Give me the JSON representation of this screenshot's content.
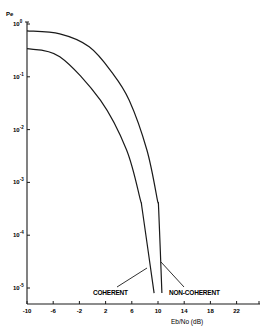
{
  "chart_data": {
    "type": "line",
    "title": "",
    "xlabel": "Eb/No (dB)",
    "ylabel": "Pe",
    "yscale": "log",
    "xlim": [
      -10,
      30
    ],
    "ylim": [
      1e-05,
      1
    ],
    "grid": false,
    "legend": "inline annotations with leader lines near bottom",
    "x_ticks": [
      -10,
      -6,
      -2,
      2,
      6,
      10,
      14,
      18,
      22
    ],
    "x_tick_labels": [
      "-10",
      "-6",
      "-2",
      "2",
      "6",
      "10",
      "14",
      "18",
      "22"
    ],
    "y_ticks": [
      1,
      0.1,
      0.01,
      0.001,
      0.0001,
      1e-05
    ],
    "y_tick_labels": [
      {
        "base": "10",
        "exp": "0"
      },
      {
        "base": "10",
        "exp": "-1"
      },
      {
        "base": "10",
        "exp": "-2"
      },
      {
        "base": "10",
        "exp": "-3"
      },
      {
        "base": "10",
        "exp": "-4"
      },
      {
        "base": "10",
        "exp": "-5"
      }
    ],
    "series": [
      {
        "name": "COHERENT",
        "x": [
          -10,
          -5,
          1.2,
          5.2,
          7.3,
          7.6,
          9.4
        ],
        "values": [
          0.34,
          0.24,
          0.036,
          0.0041,
          0.00047,
          0.0003,
          8e-06
        ]
      },
      {
        "name": "NON-COHERENT",
        "x": [
          -10,
          -5,
          -0.5,
          3,
          5.6,
          8.3,
          9.9,
          10.1,
          10.6
        ],
        "values": [
          0.74,
          0.65,
          0.37,
          0.12,
          0.036,
          0.0041,
          0.00047,
          0.0003,
          8e-06
        ]
      }
    ],
    "annotations": [
      "COHERENT",
      "NON-COHERENT"
    ]
  },
  "labels": {
    "y_axis": "Pe",
    "x_axis": "Eb/No (dB)",
    "coherent": "COHERENT",
    "non_coherent": "NON-COHERENT"
  }
}
